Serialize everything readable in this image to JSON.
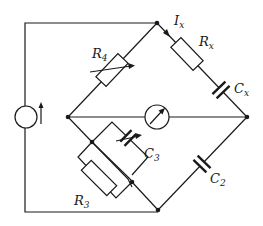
{
  "diagram": {
    "type": "bridge circuit",
    "components": {
      "source": {
        "symbol": "current-source",
        "direction": "up"
      },
      "R4": {
        "label_main": "R",
        "label_sub": "4",
        "type": "variable resistor"
      },
      "Rx": {
        "label_main": "R",
        "label_sub": "x",
        "type": "resistor"
      },
      "Cx": {
        "label_main": "C",
        "label_sub": "x",
        "type": "capacitor"
      },
      "Ix": {
        "label_main": "I",
        "label_sub": "x",
        "type": "current arrow"
      },
      "G": {
        "type": "galvanometer"
      },
      "C3": {
        "label_main": "C",
        "label_sub": "3",
        "type": "variable capacitor"
      },
      "R3": {
        "label_main": "R",
        "label_sub": "3",
        "type": "resistor"
      },
      "C2": {
        "label_main": "C",
        "label_sub": "2",
        "type": "capacitor"
      }
    }
  }
}
